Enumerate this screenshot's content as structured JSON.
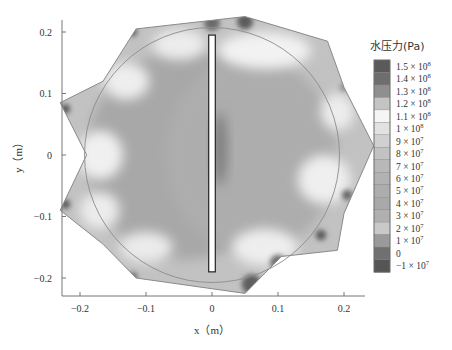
{
  "chart_data": {
    "type": "heatmap",
    "title": "",
    "xlabel": "x（m）",
    "ylabel": "y（m）",
    "xlim": [
      -0.23,
      0.27
    ],
    "ylim": [
      -0.22,
      0.225
    ],
    "x_ticks": [
      -0.2,
      -0.1,
      0,
      0.1,
      0.2
    ],
    "x_tick_labels": [
      "−0.2",
      "−0.1",
      "0",
      "0.1",
      "0.2"
    ],
    "y_ticks": [
      0.2,
      0.1,
      0,
      -0.1,
      -0.2
    ],
    "y_tick_labels": [
      "0.2",
      "0.1",
      "0",
      "−0.1",
      "−0.2"
    ],
    "grid": false,
    "domain_boundary": [
      [
        -0.115,
        0.205
      ],
      [
        0.05,
        0.225
      ],
      [
        0.175,
        0.185
      ],
      [
        0.2,
        0.11
      ],
      [
        0.245,
        0.015
      ],
      [
        0.2,
        -0.095
      ],
      [
        0.19,
        -0.155
      ],
      [
        0.105,
        -0.165
      ],
      [
        0.05,
        -0.225
      ],
      [
        -0.115,
        -0.2
      ],
      [
        -0.165,
        -0.145
      ],
      [
        -0.23,
        -0.09
      ],
      [
        -0.19,
        0.0
      ],
      [
        -0.23,
        0.085
      ],
      [
        -0.165,
        0.12
      ]
    ],
    "circle": {
      "center": [
        0.0,
        0.0
      ],
      "radius": 0.2
    },
    "slot": {
      "x_range": [
        -0.005,
        0.005
      ],
      "y_range": [
        -0.19,
        0.195
      ]
    },
    "colorbar": {
      "title": "水压力(Pa)",
      "levels": [
        {
          "value": 150000000.0,
          "label_mant": "1.5 × 10",
          "label_exp": "8",
          "color": "#5a5a5a"
        },
        {
          "value": 140000000.0,
          "label_mant": "1.4 × 10",
          "label_exp": "8",
          "color": "#6e6e6e"
        },
        {
          "value": 130000000.0,
          "label_mant": "1.3 × 10",
          "label_exp": "8",
          "color": "#8f8f8f"
        },
        {
          "value": 120000000.0,
          "label_mant": "1.2 × 10",
          "label_exp": "8",
          "color": "#c4c4c4"
        },
        {
          "value": 110000000.0,
          "label_mant": "1.1 × 10",
          "label_exp": "8",
          "color": "#f5f5f5"
        },
        {
          "value": 100000000.0,
          "label_mant": "1 × 10",
          "label_exp": "8",
          "color": "#e2e2e2"
        },
        {
          "value": 90000000.0,
          "label_mant": "9 × 10",
          "label_exp": "7",
          "color": "#d0d0d0"
        },
        {
          "value": 80000000.0,
          "label_mant": "8 × 10",
          "label_exp": "7",
          "color": "#c2c2c2"
        },
        {
          "value": 70000000.0,
          "label_mant": "7 × 10",
          "label_exp": "7",
          "color": "#b8b8b8"
        },
        {
          "value": 60000000.0,
          "label_mant": "6 × 10",
          "label_exp": "7",
          "color": "#b2b2b2"
        },
        {
          "value": 50000000.0,
          "label_mant": "5 × 10",
          "label_exp": "7",
          "color": "#adadad"
        },
        {
          "value": 40000000.0,
          "label_mant": "4 × 10",
          "label_exp": "7",
          "color": "#a9a9a9"
        },
        {
          "value": 30000000.0,
          "label_mant": "3 × 10",
          "label_exp": "7",
          "color": "#b0b0b0"
        },
        {
          "value": 20000000.0,
          "label_mant": "2 × 10",
          "label_exp": "7",
          "color": "#c9c9c9"
        },
        {
          "value": 10000000.0,
          "label_mant": "1 × 10",
          "label_exp": "7",
          "color": "#9a9a9a"
        },
        {
          "value": 0,
          "label_mant": "0",
          "label_exp": "",
          "color": "#707070"
        },
        {
          "value": -10000000.0,
          "label_mant": "−1 × 10",
          "label_exp": "7",
          "color": "#555555"
        }
      ]
    },
    "field_regions": [
      {
        "name": "interior-low",
        "center": [
          -0.04,
          0.0
        ],
        "rx": 0.15,
        "ry": 0.17,
        "color": "#a8a8a8"
      },
      {
        "name": "interior-right",
        "center": [
          0.06,
          0.0
        ],
        "rx": 0.13,
        "ry": 0.16,
        "color": "#adadad"
      },
      {
        "name": "slot-edge-dark",
        "center": [
          0.012,
          0.01
        ],
        "rx": 0.01,
        "ry": 0.06,
        "color": "#7a7a7a"
      },
      {
        "name": "light-left-mid",
        "center": [
          -0.17,
          0.0
        ],
        "rx": 0.035,
        "ry": 0.04,
        "color": "#f0f0f0"
      },
      {
        "name": "light-upper-left",
        "center": [
          -0.13,
          0.12
        ],
        "rx": 0.035,
        "ry": 0.03,
        "color": "#eeeeee"
      },
      {
        "name": "light-top-left",
        "center": [
          -0.05,
          0.18
        ],
        "rx": 0.04,
        "ry": 0.025,
        "color": "#ececec"
      },
      {
        "name": "light-top-right",
        "center": [
          0.08,
          0.17
        ],
        "rx": 0.07,
        "ry": 0.03,
        "color": "#f2f2f2"
      },
      {
        "name": "light-right-mid",
        "center": [
          0.17,
          -0.04
        ],
        "rx": 0.04,
        "ry": 0.04,
        "color": "#efefef"
      },
      {
        "name": "light-upper-right",
        "center": [
          0.19,
          0.07
        ],
        "rx": 0.025,
        "ry": 0.03,
        "color": "#ededed"
      },
      {
        "name": "light-bottom-right",
        "center": [
          0.08,
          -0.15
        ],
        "rx": 0.05,
        "ry": 0.03,
        "color": "#eeeeee"
      },
      {
        "name": "light-bottom-left",
        "center": [
          -0.1,
          -0.15
        ],
        "rx": 0.04,
        "ry": 0.025,
        "color": "#ebebeb"
      },
      {
        "name": "light-lower-left",
        "center": [
          -0.17,
          -0.09
        ],
        "rx": 0.03,
        "ry": 0.03,
        "color": "#ececec"
      }
    ],
    "hotspots": [
      {
        "center": [
          -0.222,
          0.075
        ],
        "r": 0.007,
        "color": "#555555"
      },
      {
        "center": [
          -0.222,
          -0.08
        ],
        "r": 0.007,
        "color": "#555555"
      },
      {
        "center": [
          -0.12,
          0.2
        ],
        "r": 0.007,
        "color": "#666666"
      },
      {
        "center": [
          -0.12,
          -0.198
        ],
        "r": 0.007,
        "color": "#666666"
      },
      {
        "center": [
          0.0,
          0.215
        ],
        "r": 0.012,
        "color": "#6a6a6a"
      },
      {
        "center": [
          0.05,
          0.217
        ],
        "r": 0.012,
        "color": "#5c5c5c"
      },
      {
        "center": [
          0.06,
          -0.21
        ],
        "r": 0.015,
        "color": "#5f5f5f"
      },
      {
        "center": [
          0.1,
          -0.175
        ],
        "r": 0.012,
        "color": "#707070"
      },
      {
        "center": [
          0.165,
          -0.13
        ],
        "r": 0.008,
        "color": "#5a5a5a"
      },
      {
        "center": [
          0.205,
          -0.065
        ],
        "r": 0.008,
        "color": "#666666"
      },
      {
        "center": [
          0.2,
          0.11
        ],
        "r": 0.006,
        "color": "#8a8a8a"
      }
    ]
  }
}
